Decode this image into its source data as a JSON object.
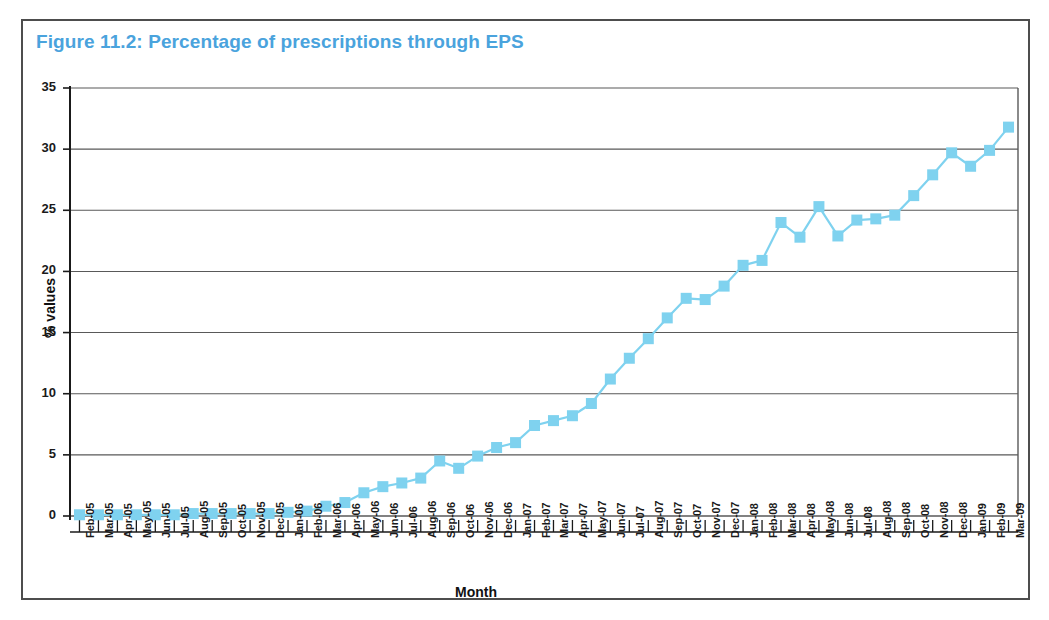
{
  "figure": {
    "title": "Figure 11.2: Percentage of prescriptions through EPS",
    "title_color": "#4aa3dd",
    "border_color": "#4d4d4d",
    "background": "#ffffff"
  },
  "chart_data": {
    "type": "line",
    "title": "Figure 11.2: Percentage of prescriptions through EPS",
    "xlabel": "Month",
    "ylabel": "% values",
    "ylim": [
      0,
      35
    ],
    "ytick_step": 5,
    "yticks": [
      0,
      5,
      10,
      15,
      20,
      25,
      30,
      35
    ],
    "grid": true,
    "grid_axis": "y",
    "legend": false,
    "marker": "square",
    "series_color": "#7fd2ef",
    "line_color": "#7fd2ef",
    "categories": [
      "Feb-05",
      "Mar-05",
      "Apr-05",
      "May-05",
      "Jun-05",
      "Jul-05",
      "Aug-05",
      "Sep-05",
      "Oct-05",
      "Nov-05",
      "Dec-05",
      "Jan-06",
      "Feb-06",
      "Mar-06",
      "Apr-06",
      "May-06",
      "Jun-06",
      "Jul-06",
      "Aug-06",
      "Sep-06",
      "Oct-06",
      "Nov-06",
      "Dec-06",
      "Jan-07",
      "Feb-07",
      "Mar-07",
      "Apr-07",
      "May-07",
      "Jun-07",
      "Jul-07",
      "Aug-07",
      "Sep-07",
      "Oct-07",
      "Nov-07",
      "Dec-07",
      "Jan-08",
      "Feb-08",
      "Mar-08",
      "Apr-08",
      "May-08",
      "Jun-08",
      "Jul-08",
      "Aug-08",
      "Sep-08",
      "Oct-08",
      "Nov-08",
      "Dec-08",
      "Jan-09",
      "Feb-09",
      "Mar-09"
    ],
    "series": [
      {
        "name": "Percentage of prescriptions through EPS",
        "values": [
          0.1,
          0.1,
          0.1,
          0.1,
          0.1,
          0.1,
          0.2,
          0.2,
          0.2,
          0.2,
          0.2,
          0.3,
          0.4,
          0.8,
          1.1,
          1.9,
          2.4,
          2.7,
          3.1,
          4.5,
          3.9,
          4.9,
          5.6,
          6.0,
          7.4,
          7.8,
          8.2,
          9.2,
          11.2,
          12.9,
          14.5,
          16.2,
          17.8,
          17.7,
          18.8,
          20.5,
          20.9,
          24.0,
          22.8,
          25.3,
          22.9,
          24.2,
          24.3,
          24.6,
          26.2,
          27.9,
          29.7,
          28.6,
          29.9,
          31.8
        ]
      }
    ]
  }
}
